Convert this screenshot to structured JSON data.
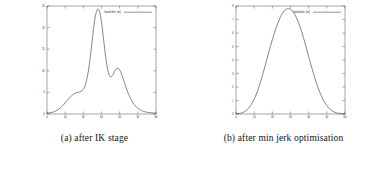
{
  "figure": {
    "panels": [
      {
        "id": "panel-a",
        "caption": "(a) after IK stage",
        "chart_data": {
          "type": "line",
          "title": "",
          "xlabel": "",
          "ylabel": "",
          "xlim": [
            0,
            60
          ],
          "ylim": [
            0,
            25
          ],
          "xticks": [
            0,
            10,
            20,
            30,
            40,
            50,
            60
          ],
          "xticklabels": [
            "0",
            "10",
            "20",
            "30",
            "40",
            "50",
            "60"
          ],
          "yticks": [
            0,
            5,
            10,
            15,
            20,
            25
          ],
          "yticklabels": [
            "0",
            "5",
            "10",
            "15",
            "20",
            "25"
          ],
          "grid": false,
          "legend_position": "top-right",
          "series": [
            {
              "name": "hand dist. (m)",
              "color": "#3a3a3a",
              "x": [
                0,
                1,
                2,
                3,
                4,
                5,
                6,
                7,
                8,
                9,
                10,
                11,
                12,
                13,
                14,
                15,
                16,
                17,
                18,
                19,
                20,
                21,
                22,
                23,
                24,
                25,
                26,
                27,
                28,
                29,
                30,
                31,
                32,
                33,
                34,
                35,
                36,
                37,
                38,
                39,
                40,
                41,
                42,
                43,
                44,
                45,
                46,
                47,
                48,
                49,
                50,
                52,
                54,
                56,
                58,
                60
              ],
              "y": [
                0.2,
                0.25,
                0.3,
                0.4,
                0.55,
                0.75,
                1.0,
                1.3,
                1.7,
                2.1,
                2.6,
                3.1,
                3.6,
                4.0,
                4.4,
                4.7,
                4.9,
                5.0,
                5.1,
                5.3,
                5.7,
                6.6,
                8.2,
                10.6,
                13.8,
                17.5,
                21.0,
                23.4,
                24.3,
                23.6,
                21.3,
                17.8,
                14.2,
                11.2,
                9.3,
                8.6,
                8.9,
                9.7,
                10.4,
                10.6,
                10.2,
                9.3,
                8.1,
                6.8,
                5.6,
                4.5,
                3.6,
                2.8,
                2.2,
                1.7,
                1.3,
                0.8,
                0.5,
                0.35,
                0.25,
                0.2
              ]
            }
          ]
        }
      },
      {
        "id": "panel-b",
        "caption": "(b) after min jerk optimisation",
        "chart_data": {
          "type": "line",
          "title": "",
          "xlabel": "",
          "ylabel": "",
          "xlim": [
            0,
            60
          ],
          "ylim": [
            0,
            8
          ],
          "xticks": [
            0,
            10,
            20,
            30,
            40,
            50,
            60
          ],
          "xticklabels": [
            "0",
            "10",
            "20",
            "30",
            "40",
            "50",
            "60"
          ],
          "yticks": [
            0,
            1,
            2,
            3,
            4,
            5,
            6,
            7,
            8
          ],
          "yticklabels": [
            "0",
            "1",
            "2",
            "3",
            "4",
            "5",
            "6",
            "7",
            "8"
          ],
          "grid": false,
          "legend_position": "top-right",
          "series": [
            {
              "name": "hand dist. (m)",
              "color": "#3a3a3a",
              "x": [
                0,
                2,
                4,
                6,
                8,
                10,
                12,
                14,
                16,
                18,
                20,
                22,
                24,
                26,
                28,
                30,
                32,
                34,
                36,
                38,
                40,
                42,
                44,
                46,
                48,
                50,
                52,
                54,
                56,
                58,
                60
              ],
              "y": [
                0.02,
                0.05,
                0.12,
                0.3,
                0.62,
                1.1,
                1.75,
                2.6,
                3.55,
                4.55,
                5.5,
                6.35,
                7.05,
                7.55,
                7.78,
                7.75,
                7.45,
                6.9,
                6.15,
                5.25,
                4.25,
                3.3,
                2.4,
                1.65,
                1.05,
                0.62,
                0.32,
                0.15,
                0.06,
                0.02,
                0.01
              ]
            }
          ]
        }
      }
    ]
  }
}
